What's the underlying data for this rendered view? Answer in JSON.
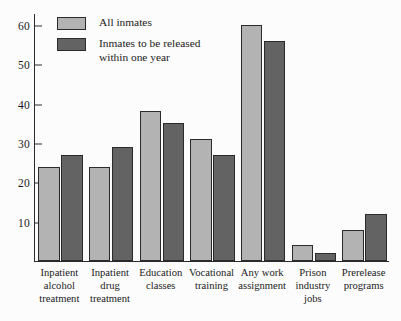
{
  "chart_data": {
    "type": "bar",
    "title": "",
    "xlabel": "",
    "ylabel": "",
    "ylim": [
      0,
      63
    ],
    "grid": false,
    "legend_position": "top-left",
    "yticks": [
      10,
      20,
      30,
      40,
      50,
      60
    ],
    "ytick_labels": [
      "10",
      "20",
      "30",
      "40",
      "50",
      "60"
    ],
    "categories": [
      "Inpatient alcohol treatment",
      "Inpatient drug treatment",
      "Education classes",
      "Vocational training",
      "Any work assignment",
      "Prison industry jobs",
      "Prerelease programs"
    ],
    "category_lines": [
      [
        "Inpatient",
        "alcohol",
        "treatment"
      ],
      [
        "Inpatient",
        "drug",
        "treatment"
      ],
      [
        "Education",
        "classes"
      ],
      [
        "Vocational",
        "training"
      ],
      [
        "Any work",
        "assignment"
      ],
      [
        "Prison",
        "industry",
        "jobs"
      ],
      [
        "Prerelease",
        "programs"
      ]
    ],
    "series": [
      {
        "name": "All inmates",
        "name_lines": [
          "All inmates"
        ],
        "color": "#b3b3b3",
        "values": [
          24,
          24,
          38,
          31,
          60,
          4,
          8
        ]
      },
      {
        "name": "Inmates to be released within one year",
        "name_lines": [
          "Inmates to be released",
          "within one year"
        ],
        "color": "#636363",
        "values": [
          27,
          29,
          35,
          27,
          56,
          2,
          12
        ]
      }
    ]
  },
  "colors": {
    "series_light": "#b3b3b3",
    "series_dark": "#636363",
    "axis": "#2a2a2a",
    "background": "#fcfcfc",
    "text": "#1a1a1a"
  }
}
